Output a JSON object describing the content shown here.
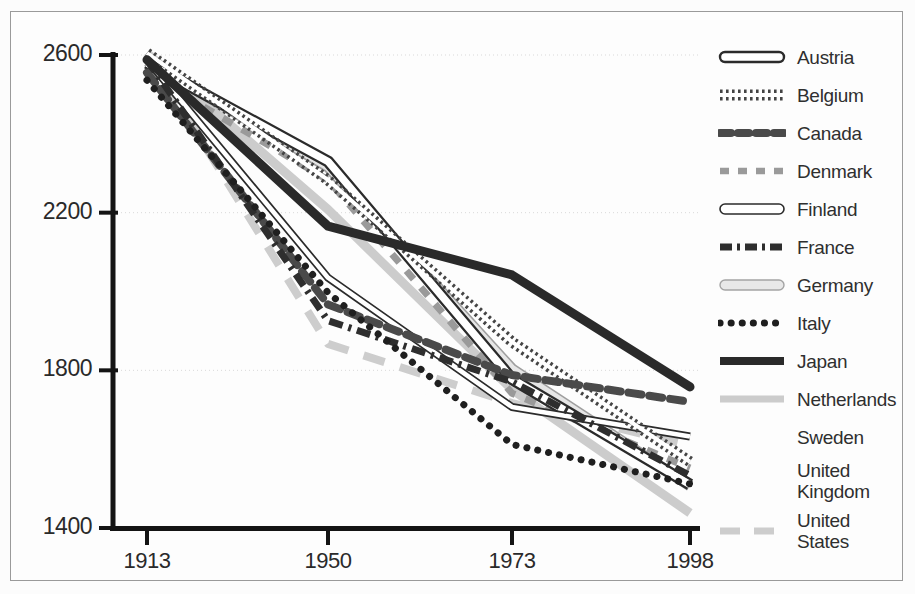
{
  "chart_data": {
    "type": "line",
    "title": "",
    "subtitle": "",
    "xlabel": "",
    "ylabel": "",
    "categories": [
      "1913",
      "1950",
      "1973",
      "1998"
    ],
    "x_tick_labels": [
      "1913",
      "1950",
      "1973",
      "1998"
    ],
    "y_tick_labels": [
      "2600",
      "2200",
      "1800",
      "1400"
    ],
    "y_tick_values": [
      2600,
      2200,
      1800,
      1400
    ],
    "ylim": [
      1400,
      2640
    ],
    "grid": "horizontal-dotted",
    "legend_position": "right",
    "series": [
      {
        "name": "Austria",
        "values": [
          2580,
          2330,
          1778,
          1510
        ],
        "style": "band-outline-white",
        "color": "#2b2b2b",
        "width": 12
      },
      {
        "name": "Belgium",
        "values": [
          2605,
          2283,
          1872,
          1568
        ],
        "style": "hatch-vertical",
        "color": "#3a3a3a",
        "width": 11
      },
      {
        "name": "Canada",
        "values": [
          2555,
          1967,
          1788,
          1720
        ],
        "style": "dash-thick",
        "color": "#555555",
        "width": 8
      },
      {
        "name": "Denmark",
        "values": [
          2553,
          2283,
          1742,
          1552
        ],
        "style": "dash-medium",
        "color": "#8d8d8d",
        "width": 7
      },
      {
        "name": "Finland",
        "values": [
          2588,
          2035,
          1707,
          1632
        ],
        "style": "band-outline-thin",
        "color": "#2b2b2b",
        "width": 8
      },
      {
        "name": "France",
        "values": [
          2588,
          1926,
          1771,
          1533
        ],
        "style": "dash-dot",
        "color": "#333333",
        "width": 7
      },
      {
        "name": "Germany",
        "values": [
          2584,
          2316,
          1804,
          1507
        ],
        "style": "band-fill-light",
        "color": "#cfcfcf",
        "width": 11
      },
      {
        "name": "Italy",
        "values": [
          2536,
          1997,
          1612,
          1512
        ],
        "style": "dotted",
        "color": "#1f1f1f",
        "width": 7
      },
      {
        "name": "Japan",
        "values": [
          2588,
          2166,
          2042,
          1758
        ],
        "style": "solid-thick",
        "color": "#2a2a2a",
        "width": 9
      },
      {
        "name": "Netherlands",
        "values": [
          2605,
          2208,
          1751,
          1438
        ],
        "style": "solid-light",
        "color": "#c6c6c6",
        "width": 9
      },
      {
        "name": "Sweden",
        "values": [
          2588,
          1951,
          1571,
          1551
        ],
        "style": "invisible-white",
        "color": "#fefefe",
        "width": 7
      },
      {
        "name": "United Kingdom",
        "values": [
          2624,
          1958,
          1688,
          1489
        ],
        "style": "invisible-white",
        "color": "#fefefe",
        "width": 7
      },
      {
        "name": "United States",
        "values": [
          2605,
          1867,
          1717,
          1610
        ],
        "style": "dash-long-light",
        "color": "#c9c9c9",
        "width": 8
      }
    ],
    "legend_entries": [
      {
        "label": "Austria",
        "swatch": "band-outline-white"
      },
      {
        "label": "Belgium",
        "swatch": "hatch-vertical"
      },
      {
        "label": "Canada",
        "swatch": "dash-thick"
      },
      {
        "label": "Denmark",
        "swatch": "dash-medium"
      },
      {
        "label": "Finland",
        "swatch": "band-outline-thin"
      },
      {
        "label": "France",
        "swatch": "dash-dot"
      },
      {
        "label": "Germany",
        "swatch": "band-fill-light"
      },
      {
        "label": "Italy",
        "swatch": "dotted"
      },
      {
        "label": "Japan",
        "swatch": "solid-thick"
      },
      {
        "label": "Netherlands",
        "swatch": "solid-light"
      },
      {
        "label": "Sweden",
        "swatch": "invisible-white"
      },
      {
        "label": "United",
        "label2": "Kingdom",
        "swatch": "invisible-white"
      },
      {
        "label": "United",
        "label2": "States",
        "swatch": "dash-long-light"
      }
    ]
  },
  "colors": {
    "background": "#fdfdfd",
    "border": "#9a9a9a",
    "axis": "#1a1a1a",
    "grid": "#d9d9d9",
    "text": "#2a2a2a"
  }
}
